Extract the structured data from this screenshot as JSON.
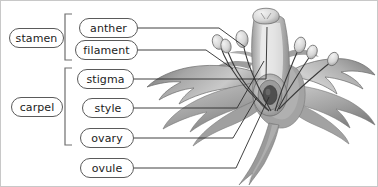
{
  "diagram": {
    "background_color": "#ffffff",
    "border_color": "#c8c8c8",
    "label_border_color": "#5a5a5a",
    "leader_line_color": "#2b2b2b",
    "bracket_color": "#6e6e6e",
    "illustration_tones": {
      "petal_light": "#d2d2d2",
      "petal_mid": "#a8a8a8",
      "petal_dark": "#7d7d7d",
      "petal_shadow": "#5e5e5e",
      "stamen_light": "#e2e2e2",
      "ovary_dark": "#4a4a4a"
    }
  },
  "groups": [
    {
      "id": "stamen",
      "label": "stamen",
      "members": [
        "anther",
        "filament"
      ]
    },
    {
      "id": "carpel",
      "label": "carpel",
      "members": [
        "stigma",
        "style",
        "ovary"
      ]
    }
  ],
  "labels": [
    {
      "id": "anther",
      "label": "anther"
    },
    {
      "id": "filament",
      "label": "filament"
    },
    {
      "id": "stigma",
      "label": "stigma"
    },
    {
      "id": "style",
      "label": "style"
    },
    {
      "id": "ovary",
      "label": "ovary"
    },
    {
      "id": "ovule",
      "label": "ovule"
    }
  ]
}
